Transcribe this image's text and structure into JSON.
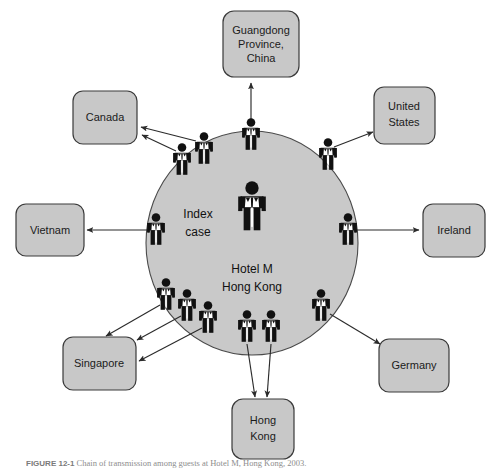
{
  "figure": {
    "type": "diagram",
    "caption_number": "FIGURE 12-1",
    "caption_text": "Chain of transmission among guests at Hotel M, Hong Kong, 2003.",
    "center": {
      "index_case_label": "Index\ncase",
      "index_case_line1": "Index",
      "index_case_line2": "case",
      "hotel_line1": "Hotel M",
      "hotel_line2": "Hong Kong"
    },
    "colors": {
      "box_fill": "#c8c8c8",
      "box_stroke": "#3a3a3a",
      "ellipse_fill": "#c9c9c9",
      "ellipse_stroke": "#4a4a4a",
      "arrow": "#2b2b2b",
      "person": "#111111",
      "background": "#ffffff"
    },
    "destinations": [
      {
        "id": "guangdong",
        "label": "Guangdong\nProvince,\nChina",
        "lines": [
          "Guangdong",
          "Province,",
          "China"
        ],
        "x": 261,
        "y": 44,
        "w": 76,
        "h": 66,
        "rx": 11
      },
      {
        "id": "canada",
        "label": "Canada",
        "lines": [
          "Canada"
        ],
        "x": 105,
        "y": 117,
        "w": 64,
        "h": 53,
        "rx": 10
      },
      {
        "id": "united-states",
        "label": "United\nStates",
        "lines": [
          "United",
          "States"
        ],
        "x": 404,
        "y": 115,
        "w": 61,
        "h": 57,
        "rx": 10
      },
      {
        "id": "vietnam",
        "label": "Vietnam",
        "lines": [
          "Vietnam"
        ],
        "x": 50,
        "y": 231,
        "w": 68,
        "h": 52,
        "rx": 10
      },
      {
        "id": "ireland",
        "label": "Ireland",
        "lines": [
          "Ireland"
        ],
        "x": 454,
        "y": 231,
        "w": 62,
        "h": 53,
        "rx": 10
      },
      {
        "id": "singapore",
        "label": "Singapore",
        "lines": [
          "Singapore"
        ],
        "x": 99,
        "y": 364,
        "w": 73,
        "h": 53,
        "rx": 10
      },
      {
        "id": "germany",
        "label": "Germany",
        "lines": [
          "Germany"
        ],
        "x": 414,
        "y": 365,
        "w": 70,
        "h": 53,
        "rx": 10
      },
      {
        "id": "hong-kong",
        "label": "Hong\nKong",
        "lines": [
          "Hong",
          "Kong"
        ],
        "x": 263,
        "y": 430,
        "w": 62,
        "h": 60,
        "rx": 11
      }
    ],
    "hub": {
      "cx": 252,
      "cy": 243,
      "rx": 106,
      "ry": 112
    },
    "people": [
      {
        "id": "index-case",
        "x": 252,
        "y": 205,
        "scale": 1.5,
        "on_ellipse": false
      },
      {
        "id": "person-guangdong",
        "x": 251,
        "y": 138,
        "scale": 1.0,
        "on_ellipse": true
      },
      {
        "id": "person-canada-a",
        "x": 182,
        "y": 160,
        "scale": 1.0,
        "on_ellipse": true
      },
      {
        "id": "person-canada-b",
        "x": 203,
        "y": 150,
        "scale": 1.0,
        "on_ellipse": true
      },
      {
        "id": "person-us",
        "x": 327,
        "y": 155,
        "scale": 1.0,
        "on_ellipse": true
      },
      {
        "id": "person-vietnam",
        "x": 156,
        "y": 230,
        "scale": 1.0,
        "on_ellipse": true
      },
      {
        "id": "person-ireland",
        "x": 347,
        "y": 230,
        "scale": 1.0,
        "on_ellipse": true
      },
      {
        "id": "person-singapore-a",
        "x": 166,
        "y": 295,
        "scale": 1.0,
        "on_ellipse": true
      },
      {
        "id": "person-singapore-b",
        "x": 186,
        "y": 305,
        "scale": 1.0,
        "on_ellipse": true
      },
      {
        "id": "person-singapore-c",
        "x": 207,
        "y": 316,
        "scale": 1.0,
        "on_ellipse": true
      },
      {
        "id": "person-hk-a",
        "x": 247,
        "y": 325,
        "scale": 1.0,
        "on_ellipse": true
      },
      {
        "id": "person-hk-b",
        "x": 271,
        "y": 325,
        "scale": 1.0,
        "on_ellipse": true
      },
      {
        "id": "person-germany",
        "x": 320,
        "y": 305,
        "scale": 1.0,
        "on_ellipse": true
      }
    ],
    "arrows": [
      {
        "id": "arrow-to-guangdong",
        "from": "person-guangdong",
        "to": "guangdong",
        "x1": 251,
        "y1": 122,
        "x2": 251,
        "y2": 82
      },
      {
        "id": "arrow-to-canada-a",
        "from": "person-canada-a",
        "to": "canada",
        "x1": 176,
        "y1": 150,
        "x2": 140,
        "y2": 134
      },
      {
        "id": "arrow-to-canada-b",
        "from": "person-canada-b",
        "to": "canada",
        "x1": 196,
        "y1": 140,
        "x2": 139,
        "y2": 126
      },
      {
        "id": "arrow-to-united-states",
        "from": "person-us",
        "to": "united-states",
        "x1": 334,
        "y1": 146,
        "x2": 374,
        "y2": 131
      },
      {
        "id": "arrow-to-vietnam",
        "from": "person-vietnam",
        "to": "vietnam",
        "x1": 148,
        "y1": 230,
        "x2": 86,
        "y2": 230
      },
      {
        "id": "arrow-to-ireland",
        "from": "person-ireland",
        "to": "ireland",
        "x1": 356,
        "y1": 230,
        "x2": 420,
        "y2": 230
      },
      {
        "id": "arrow-to-singapore-a",
        "from": "person-singapore-a",
        "to": "singapore",
        "x1": 160,
        "y1": 305,
        "x2": 104,
        "y2": 337
      },
      {
        "id": "arrow-to-singapore-b",
        "from": "person-singapore-b",
        "to": "singapore",
        "x1": 180,
        "y1": 316,
        "x2": 136,
        "y2": 341
      },
      {
        "id": "arrow-to-singapore-c",
        "from": "person-singapore-c",
        "to": "singapore",
        "x1": 201,
        "y1": 327,
        "x2": 137,
        "y2": 362
      },
      {
        "id": "arrow-to-hong-kong-a",
        "from": "person-hk-a",
        "to": "hong-kong",
        "x1": 247,
        "y1": 345,
        "x2": 254,
        "y2": 398
      },
      {
        "id": "arrow-to-hong-kong-b",
        "from": "person-hk-b",
        "to": "hong-kong",
        "x1": 271,
        "y1": 345,
        "x2": 267,
        "y2": 398
      },
      {
        "id": "arrow-to-germany",
        "from": "person-germany",
        "to": "germany",
        "x1": 330,
        "y1": 315,
        "x2": 381,
        "y2": 345
      }
    ]
  }
}
